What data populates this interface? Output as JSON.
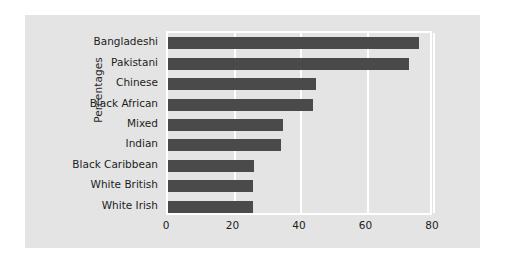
{
  "chart_data": {
    "type": "bar",
    "orientation": "horizontal",
    "title": "",
    "xlabel": "",
    "ylabel": "Percentages",
    "categories": [
      "Bangladeshi",
      "Pakistani",
      "Chinese",
      "Black African",
      "Mixed",
      "Indian",
      "Black Caribbean",
      "White British",
      "White Irish"
    ],
    "values": [
      75.5,
      72.5,
      44.5,
      43.5,
      34.5,
      34,
      26,
      25.5,
      25.5
    ],
    "xlim": [
      0,
      80
    ],
    "xticks": [
      0,
      20,
      40,
      60,
      80
    ],
    "xtick_labels": [
      "0",
      "20",
      "40",
      "60",
      "80"
    ],
    "grid": true,
    "grid_color": "#ffffff",
    "legend": null,
    "bar_color": "#4a4a4a",
    "figure_background": "#e4e4e4",
    "page_background": "#ffffff"
  }
}
